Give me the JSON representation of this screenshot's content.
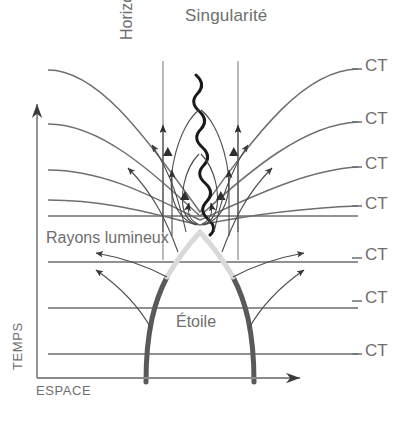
{
  "diagram": {
    "title": "Singularité",
    "axes": {
      "y_label": "TEMPS",
      "x_label": "ESPACE",
      "y_arrow_icon": "arrow-up-icon",
      "x_arrow_icon": "arrow-right-icon"
    },
    "labels": {
      "singularite": "Singularité",
      "horizon": "Horizon",
      "rayons": "Rayons lumineux",
      "etoile": "Étoile"
    },
    "ct_lines": [
      {
        "label": "CT",
        "y": 68,
        "kind": "curved"
      },
      {
        "label": "CT",
        "y": 121,
        "kind": "curved"
      },
      {
        "label": "CT",
        "y": 166,
        "kind": "curved"
      },
      {
        "label": "CT",
        "y": 206,
        "kind": "curved"
      },
      {
        "label": "CT",
        "y": 257,
        "kind": "straight"
      },
      {
        "label": "CT",
        "y": 300,
        "kind": "straight"
      },
      {
        "label": "CT",
        "y": 353,
        "kind": "straight"
      }
    ],
    "colors": {
      "text": "#6e6e6e",
      "line": "#6e6e6e",
      "axis": "#8a8a8a",
      "star_dark": "#595959",
      "star_light": "#d9d9d9",
      "singularity": "#1a1a1a",
      "ray": "#4a4a4a"
    }
  },
  "chart_data": {
    "type": "line",
    "title": "Singularité",
    "xlabel": "ESPACE",
    "ylabel": "TEMPS",
    "grid": false,
    "legend": "none",
    "annotations": [
      "Singularité",
      "Horizon",
      "Rayons lumineux",
      "Étoile"
    ],
    "series": [
      {
        "name": "CT",
        "note": "constant-time slice 1 (curved)"
      },
      {
        "name": "CT",
        "note": "constant-time slice 2 (curved)"
      },
      {
        "name": "CT",
        "note": "constant-time slice 3 (curved)"
      },
      {
        "name": "CT",
        "note": "constant-time slice 4 (curved)"
      },
      {
        "name": "CT",
        "note": "constant-time slice 5 (flat)"
      },
      {
        "name": "CT",
        "note": "constant-time slice 6 (flat)"
      },
      {
        "name": "CT",
        "note": "constant-time slice 7 (flat)"
      }
    ]
  }
}
